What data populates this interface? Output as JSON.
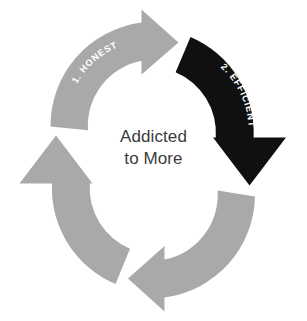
{
  "diagram": {
    "type": "cycle-diagram",
    "title": "Addicted to More",
    "background_color": "#ffffff",
    "center": {
      "line1": "Addicted",
      "line2": "to More",
      "text_color": "#3b3b3b"
    },
    "colors": {
      "arrow_gray": "#a9a9a9",
      "arrow_black": "#101010",
      "label_text": "#ffffff",
      "center_text": "#3b3b3b"
    },
    "steps": [
      {
        "index": 1,
        "label": "1. HONEST",
        "color": "#a9a9a9",
        "position": "top-left",
        "highlighted": false,
        "direction": "clockwise"
      },
      {
        "index": 2,
        "label": "2. EFFICIENT",
        "color": "#101010",
        "position": "top-right",
        "highlighted": true,
        "direction": "clockwise"
      },
      {
        "index": 3,
        "label": "",
        "color": "#a9a9a9",
        "position": "bottom-right",
        "highlighted": false,
        "direction": "clockwise"
      },
      {
        "index": 4,
        "label": "",
        "color": "#a9a9a9",
        "position": "bottom-left",
        "highlighted": false,
        "direction": "clockwise"
      }
    ]
  }
}
